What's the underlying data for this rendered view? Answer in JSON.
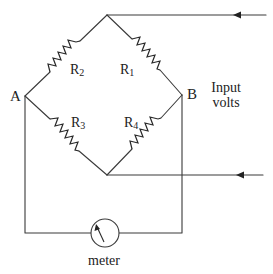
{
  "diagram": {
    "type": "wheatstone-bridge-circuit",
    "nodes": {
      "left": "A",
      "right": "B"
    },
    "resistors": [
      {
        "id": "R1",
        "label": "R",
        "subscript": "1",
        "arm": "top-right"
      },
      {
        "id": "R2",
        "label": "R",
        "subscript": "2",
        "arm": "top-left"
      },
      {
        "id": "R3",
        "label": "R",
        "subscript": "3",
        "arm": "bottom-left"
      },
      {
        "id": "R4",
        "label": "R",
        "subscript": "4",
        "arm": "bottom-right"
      }
    ],
    "input": {
      "line1": "Input",
      "line2": "volts"
    },
    "meter": {
      "label": "meter",
      "icon": "galvanometer-dial-icon"
    },
    "colors": {
      "line": "#3a3a3a",
      "text": "#222222",
      "background": "#ffffff"
    }
  }
}
